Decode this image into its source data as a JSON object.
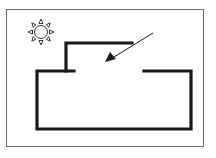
{
  "diagram": {
    "colors": {
      "background": "#ffffff",
      "frame": "#6a6a6a",
      "structure": "#1a1a1a",
      "sun": "#333333",
      "arrow": "#1a1a1a"
    },
    "icons": {
      "sun": "sun-icon",
      "arrow": "arrow-pointer-icon"
    }
  }
}
